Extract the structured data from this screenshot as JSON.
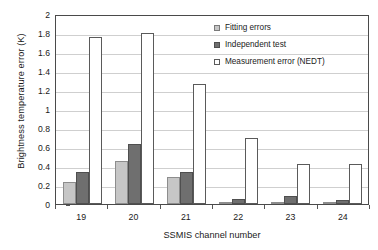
{
  "chart_data": {
    "type": "bar",
    "title": "",
    "xlabel": "SSMIS channel number",
    "ylabel": "Brightness temperature error (K)",
    "categories": [
      "19",
      "20",
      "21",
      "22",
      "23",
      "24"
    ],
    "series": [
      {
        "name": "Fitting errors",
        "color": "#c6c6c6",
        "values": [
          0.23,
          0.45,
          0.28,
          0.01,
          0.01,
          0.01
        ]
      },
      {
        "name": "Independent test",
        "color": "#6f6f6f",
        "values": [
          0.34,
          0.63,
          0.335,
          0.05,
          0.08,
          0.045
        ]
      },
      {
        "name": "Measurement error (NEDT)",
        "color": "#ffffff",
        "values": [
          1.76,
          1.8,
          1.26,
          0.69,
          0.42,
          0.425
        ]
      }
    ],
    "ylim": [
      0,
      2
    ],
    "ytick_step": 0.2,
    "yticks": [
      "2",
      "1.8",
      "1.6",
      "1.4",
      "1.2",
      "1",
      "0.8",
      "0.6",
      "0.4",
      "0.2",
      "0"
    ],
    "grid": "horizontal",
    "legend_position": "top-right",
    "frame": true
  },
  "legend": {
    "items": [
      {
        "label": "Fitting errors"
      },
      {
        "label": "Independent test"
      },
      {
        "label": "Measurement error (NEDT)"
      }
    ]
  }
}
